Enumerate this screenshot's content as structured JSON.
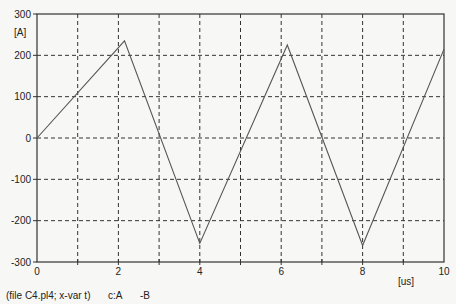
{
  "chart_data": {
    "type": "line",
    "title": "",
    "xlabel": "[us]",
    "ylabel": "[A]",
    "xlim": [
      0,
      10
    ],
    "ylim": [
      -300,
      300
    ],
    "x_ticks": [
      0,
      2,
      4,
      6,
      8,
      10
    ],
    "x_tick_labels": [
      "0",
      "2",
      "4",
      "6",
      "8",
      "10"
    ],
    "y_ticks": [
      300,
      200,
      100,
      0,
      -100,
      -200,
      -300
    ],
    "y_tick_labels": [
      "300",
      "200",
      "100",
      "0",
      "-100",
      "-200",
      "-300"
    ],
    "grid": true,
    "series": [
      {
        "name": "c:A -B",
        "x": [
          0,
          2.15,
          4.0,
          6.15,
          8.0,
          10.0
        ],
        "y": [
          0,
          235,
          -255,
          225,
          -260,
          215
        ]
      }
    ],
    "footer": "(file C4.pl4; x-var t)",
    "legend": [
      "c:A",
      "-B"
    ]
  },
  "footer": {
    "file_label": "(file C4.pl4; x-var t)",
    "legend_c": "c:A",
    "legend_b": "-B"
  },
  "axes": {
    "y_unit": "[A]",
    "x_unit": "[us]"
  }
}
